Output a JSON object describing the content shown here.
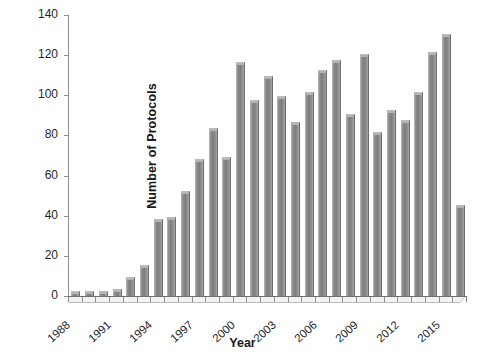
{
  "chart_data": {
    "type": "bar",
    "title": "",
    "xlabel": "Year",
    "ylabel": "Number of Protocols",
    "categories": [
      "1988",
      "1989",
      "1990",
      "1991",
      "1992",
      "1993",
      "1994",
      "1995",
      "1996",
      "1997",
      "1998",
      "1999",
      "2000",
      "2001",
      "2002",
      "2003",
      "2004",
      "2005",
      "2006",
      "2007",
      "2008",
      "2009",
      "2010",
      "2011",
      "2012",
      "2013",
      "2014",
      "2015",
      "2016"
    ],
    "values": [
      2,
      2,
      2,
      3,
      9,
      15,
      38,
      39,
      52,
      68,
      83,
      69,
      116,
      97,
      109,
      99,
      86,
      101,
      112,
      117,
      90,
      120,
      81,
      92,
      87,
      101,
      121,
      130,
      45
    ],
    "ylim": [
      0,
      140
    ],
    "yticks": [
      0,
      20,
      40,
      60,
      80,
      100,
      120,
      140
    ],
    "xtick_labels": [
      "1988",
      "1991",
      "1994",
      "1997",
      "2000",
      "2003",
      "2006",
      "2009",
      "2012",
      "2015"
    ],
    "xtick_indices": [
      0,
      3,
      6,
      9,
      12,
      15,
      18,
      21,
      24,
      27
    ],
    "grid": false,
    "legend": "none",
    "bar_color": "#808080",
    "axis_color": "#8d8d8d",
    "background": "#ffffff"
  }
}
